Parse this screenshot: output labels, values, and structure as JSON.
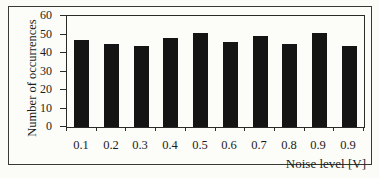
{
  "chart_data": {
    "type": "bar",
    "categories": [
      "0.1",
      "0.2",
      "0.3",
      "0.4",
      "0.5",
      "0.6",
      "0.7",
      "0.8",
      "0.9",
      "0.9"
    ],
    "values": [
      47,
      45,
      44,
      48,
      51,
      46,
      49,
      45,
      51,
      44
    ],
    "title": "",
    "xlabel": "Noise level [V]",
    "ylabel": "Number of occurrences",
    "ylim": [
      0,
      60
    ],
    "yticks": [
      0,
      10,
      20,
      30,
      40,
      50,
      60
    ],
    "grid": false,
    "legend": null,
    "bar_color": "#141414",
    "axis_color": "#2a2a26",
    "text_color": "#1c1c1a",
    "paper_color": "#fcfcf9"
  }
}
